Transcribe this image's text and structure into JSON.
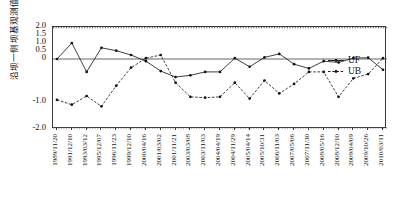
{
  "chart_data": {
    "type": "line",
    "title": "",
    "xlabel": "",
    "ylabel": "沿坝一侧坝基观测值统计值",
    "ylim": [
      -2.0,
      2.0
    ],
    "grid": false,
    "legend_position": "right",
    "y_ticks": [
      "2.0",
      "1.5",
      "1.0",
      "0.5",
      "0",
      "-1.0",
      "-2.0"
    ],
    "y_tick_values": [
      2.0,
      1.5,
      1.0,
      0.5,
      0,
      -1.0,
      -2.0
    ],
    "categories": [
      "1989/11/20",
      "1991/12/10",
      "1993/03/12",
      "1995/12/07",
      "1996/11/23",
      "1999/12/10",
      "2000/04/16",
      "2001/03/02",
      "2001/11/21",
      "2003/03/08",
      "2003/11/03",
      "2004/04/19",
      "2004/11/29",
      "2005/04/14",
      "2005/10/31",
      "2006/11/03",
      "2007/05/06",
      "2007/11/30",
      "2008/05/16",
      "2008/12/10",
      "2009/04/09",
      "2009/10/26",
      "2010/03/11"
    ],
    "series": [
      {
        "name": "UF",
        "style": "solid",
        "marker": "dot",
        "values": [
          0.0,
          1.0,
          -0.3,
          0.7,
          0.52,
          0.25,
          -0.05,
          -0.28,
          -0.42,
          -0.38,
          -0.3,
          -0.3,
          0.05,
          -0.18,
          0.1,
          0.32,
          -0.12,
          -0.22,
          -0.05,
          -0.08,
          0.05,
          0.08,
          -0.25
        ]
      },
      {
        "name": "UB",
        "style": "dashed",
        "marker": "dot",
        "values": [
          -0.95,
          -1.1,
          -0.86,
          -1.16,
          -0.62,
          -0.2,
          0.05,
          0.25,
          -0.55,
          -0.88,
          -0.9,
          -0.88,
          -0.55,
          -0.92,
          -0.5,
          -0.8,
          -0.58,
          -0.3,
          -0.3,
          -0.88,
          -0.45,
          -0.35,
          0.05
        ]
      }
    ],
    "reference_lines": [
      {
        "value": 1.96,
        "style": "dotted",
        "label": ""
      },
      {
        "value": -1.96,
        "style": "dotted",
        "label": ""
      },
      {
        "value": 0,
        "style": "solid",
        "label": ""
      }
    ]
  },
  "legend": {
    "items": [
      {
        "label": "UF",
        "style": "solid"
      },
      {
        "label": "UB",
        "style": "dashed"
      }
    ]
  }
}
